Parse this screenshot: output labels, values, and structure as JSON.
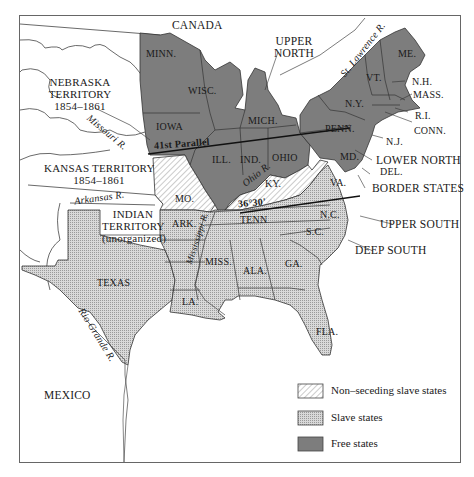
{
  "map": {
    "countries": {
      "canada": "CANADA",
      "mexico": "MEXICO"
    },
    "territories": {
      "nebraska": {
        "name": "NEBRASKA",
        "line2": "TERRITORY",
        "years": "1854–1861"
      },
      "kansas": {
        "name": "KANSAS TERRITORY",
        "years": "1854–1861"
      },
      "indian": {
        "name": "INDIAN",
        "line2": "TERRITORY",
        "note": "(unorganized)"
      }
    },
    "states": {
      "minn": "MINN.",
      "wisc": "WISC.",
      "iowa": "IOWA",
      "mich": "MICH.",
      "ill": "ILL.",
      "ind": "IND.",
      "ohio": "OHIO",
      "ny": "N.Y.",
      "penn": "PENN.",
      "vt": "VT.",
      "me": "ME.",
      "nh": "N.H.",
      "mass": "MASS.",
      "ri": "R.I.",
      "conn": "CONN.",
      "nj": "N.J.",
      "md": "MD.",
      "del": "DEL.",
      "mo": "MO.",
      "ky": "KY.",
      "va": "VA.",
      "tenn": "TENN",
      "nc": "N.C.",
      "sc": "S.C.",
      "ga": "GA.",
      "ala": "ALA.",
      "miss": "MISS.",
      "la": "LA.",
      "ark": "ARK.",
      "texas": "TEXAS",
      "fla": "FLA."
    },
    "rivers": {
      "missouri": "Missouri R.",
      "arkansas": "Arkansas R.",
      "mississippi": "Mississippi R.",
      "ohio": "Ohio R.",
      "rio_grande": "Rio Grande R.",
      "st_lawrence": "St. Lawrence R."
    },
    "lines": {
      "parallel_41": "41st Parallel",
      "parallel_36_30": "36°30'"
    },
    "regions": {
      "upper_north": {
        "line1": "UPPER",
        "line2": "NORTH"
      },
      "lower_north": "LOWER NORTH",
      "border_states": "BORDER STATES",
      "upper_south": "UPPER SOUTH",
      "deep_south": "DEEP SOUTH"
    },
    "colors": {
      "free": "#7d7d7d",
      "slave": "#cfcfcf",
      "nonseceding_hatch": "#bdbdbd",
      "border": "#333333",
      "water": "#ffffff"
    }
  },
  "legend": {
    "items": [
      {
        "label": "Non–seceding slave states",
        "pattern": "hatch"
      },
      {
        "label": "Slave states",
        "pattern": "crosshatch"
      },
      {
        "label": "Free states",
        "pattern": "solid-dark"
      }
    ]
  }
}
